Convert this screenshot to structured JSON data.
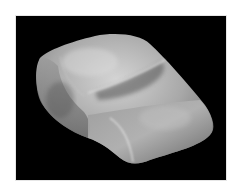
{
  "image": {
    "description": "Grayscale photograph of a translucent rounded stone, shaped like a cushion, on a black background",
    "subject": "translucent stone",
    "background_color": "#000000",
    "border_color": "#ffffff",
    "stone_colors": {
      "highlight": "#d8d8d8",
      "mid": "#a6a6a6",
      "shadow": "#5e5e5e"
    }
  }
}
